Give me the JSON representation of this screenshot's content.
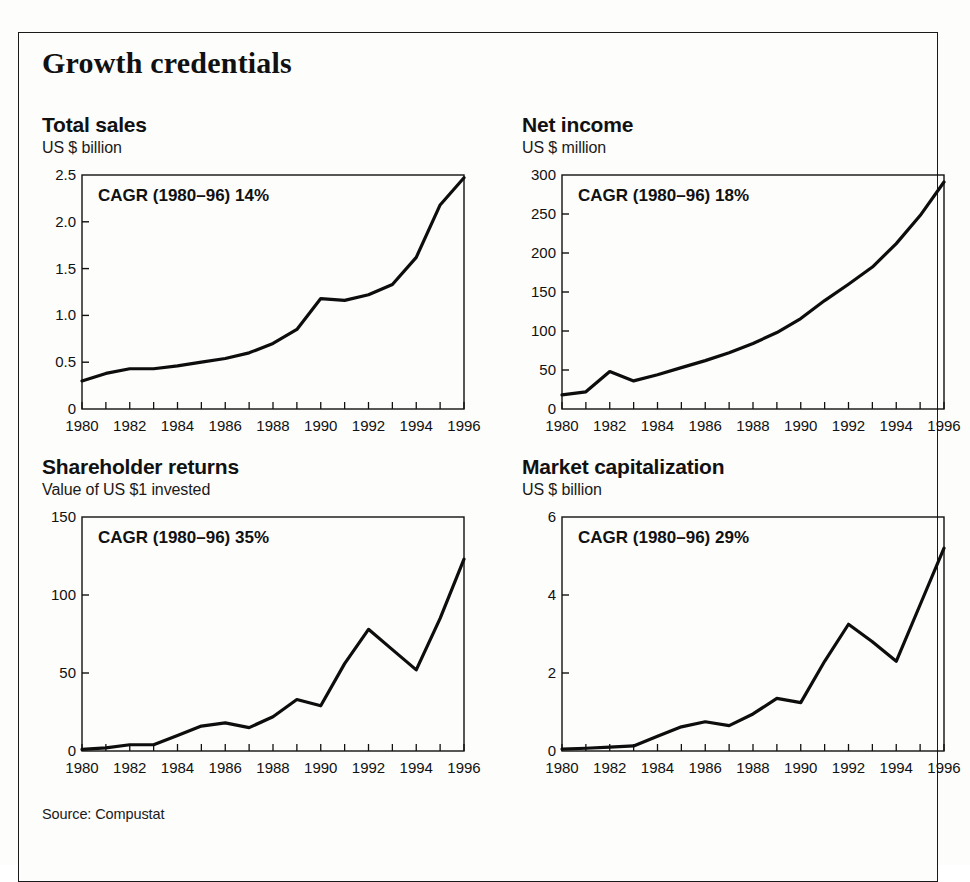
{
  "figure": {
    "title": "Growth credentials",
    "source": "Source: Compustat"
  },
  "chart_data": [
    {
      "type": "line",
      "title": "Total sales",
      "subtitle": "US $ billion",
      "ylabel": "US $ billion",
      "xlabel": "",
      "annotation": "CAGR (1980–96) 14%",
      "cagr_percent": 14,
      "cagr_period": "1980–96",
      "x": [
        1980,
        1981,
        1982,
        1983,
        1984,
        1985,
        1986,
        1987,
        1988,
        1989,
        1990,
        1991,
        1992,
        1993,
        1994,
        1995,
        1996
      ],
      "values": [
        0.3,
        0.38,
        0.43,
        0.43,
        0.46,
        0.5,
        0.54,
        0.6,
        0.7,
        0.85,
        1.18,
        1.16,
        1.22,
        1.33,
        1.62,
        2.18,
        2.47
      ],
      "xtick_labels": [
        "1980",
        "1982",
        "1984",
        "1986",
        "1988",
        "1990",
        "1992",
        "1994",
        "1996"
      ],
      "xtick_values": [
        1980,
        1982,
        1984,
        1986,
        1988,
        1990,
        1992,
        1994,
        1996
      ],
      "ytick_labels": [
        "0",
        "0.5",
        "1.0",
        "1.5",
        "2.0",
        "2.5"
      ],
      "ytick_values": [
        0,
        0.5,
        1.0,
        1.5,
        2.0,
        2.5
      ],
      "xlim": [
        1980,
        1996
      ],
      "ylim": [
        0,
        2.5
      ],
      "grid": false,
      "legend": "none"
    },
    {
      "type": "line",
      "title": "Net income",
      "subtitle": "US $ million",
      "ylabel": "US $ million",
      "xlabel": "",
      "annotation": "CAGR (1980–96) 18%",
      "cagr_percent": 18,
      "cagr_period": "1980–96",
      "x": [
        1980,
        1981,
        1982,
        1983,
        1984,
        1985,
        1986,
        1987,
        1988,
        1989,
        1990,
        1991,
        1992,
        1993,
        1994,
        1995,
        1996
      ],
      "values": [
        18,
        22,
        48,
        36,
        44,
        53,
        62,
        72,
        84,
        98,
        116,
        139,
        160,
        182,
        212,
        248,
        291
      ],
      "xtick_labels": [
        "1980",
        "1982",
        "1984",
        "1986",
        "1988",
        "1990",
        "1992",
        "1994",
        "1996"
      ],
      "xtick_values": [
        1980,
        1982,
        1984,
        1986,
        1988,
        1990,
        1992,
        1994,
        1996
      ],
      "ytick_labels": [
        "0",
        "50",
        "100",
        "150",
        "200",
        "250",
        "300"
      ],
      "ytick_values": [
        0,
        50,
        100,
        150,
        200,
        250,
        300
      ],
      "xlim": [
        1980,
        1996
      ],
      "ylim": [
        0,
        300
      ],
      "grid": false,
      "legend": "none"
    },
    {
      "type": "line",
      "title": "Shareholder returns",
      "subtitle": "Value of US $1 invested",
      "ylabel": "Value of US $1 invested",
      "xlabel": "",
      "annotation": "CAGR (1980–96) 35%",
      "cagr_percent": 35,
      "cagr_period": "1980–96",
      "x": [
        1980,
        1981,
        1982,
        1983,
        1984,
        1985,
        1986,
        1987,
        1988,
        1989,
        1990,
        1991,
        1992,
        1993,
        1994,
        1995,
        1996
      ],
      "values": [
        1,
        2,
        4,
        4,
        10,
        16,
        18,
        15,
        22,
        33,
        29,
        56,
        78,
        65,
        52,
        85,
        123
      ],
      "xtick_labels": [
        "1980",
        "1982",
        "1984",
        "1986",
        "1988",
        "1990",
        "1992",
        "1994",
        "1996"
      ],
      "xtick_values": [
        1980,
        1982,
        1984,
        1986,
        1988,
        1990,
        1992,
        1994,
        1996
      ],
      "ytick_labels": [
        "0",
        "50",
        "100",
        "150"
      ],
      "ytick_values": [
        0,
        50,
        100,
        150
      ],
      "xlim": [
        1980,
        1996
      ],
      "ylim": [
        0,
        150
      ],
      "grid": false,
      "legend": "none"
    },
    {
      "type": "line",
      "title": "Market capitalization",
      "subtitle": "US $ billion",
      "ylabel": "US $ billion",
      "xlabel": "",
      "annotation": "CAGR (1980–96) 29%",
      "cagr_percent": 29,
      "cagr_period": "1980–96",
      "x": [
        1980,
        1981,
        1982,
        1983,
        1984,
        1985,
        1986,
        1987,
        1988,
        1989,
        1990,
        1991,
        1992,
        1993,
        1994,
        1995,
        1996
      ],
      "values": [
        0.05,
        0.07,
        0.1,
        0.13,
        0.38,
        0.62,
        0.75,
        0.65,
        0.95,
        1.35,
        1.24,
        2.3,
        3.25,
        2.8,
        2.3,
        3.75,
        5.2
      ],
      "xtick_labels": [
        "1980",
        "1982",
        "1984",
        "1986",
        "1988",
        "1990",
        "1992",
        "1994",
        "1996"
      ],
      "xtick_values": [
        1980,
        1982,
        1984,
        1986,
        1988,
        1990,
        1992,
        1994,
        1996
      ],
      "ytick_labels": [
        "0",
        "2",
        "4",
        "6"
      ],
      "ytick_values": [
        0,
        2,
        4,
        6
      ],
      "xlim": [
        1980,
        1996
      ],
      "ylim": [
        0,
        6
      ],
      "grid": false,
      "legend": "none"
    }
  ],
  "colors": {
    "line": "#0d0d0d",
    "axis": "#111111",
    "text": "#111111",
    "background": "#fdfdfb",
    "border": "#1a1a1a"
  }
}
